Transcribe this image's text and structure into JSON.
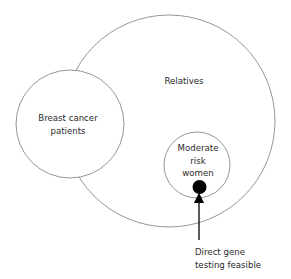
{
  "diagram": {
    "regions": {
      "relatives": {
        "label": "Relatives"
      },
      "breast_cancer_patients": {
        "label_line1": "Breast cancer",
        "label_line2": "patients"
      },
      "moderate_risk_women": {
        "label_line1": "Moderate",
        "label_line2": "risk",
        "label_line3": "women"
      }
    },
    "annotation": {
      "label_line1": "Direct gene",
      "label_line2": "testing feasible"
    },
    "colors": {
      "stroke": "#8a8a8a",
      "dot": "#000000",
      "text": "#2a2a2a"
    }
  }
}
